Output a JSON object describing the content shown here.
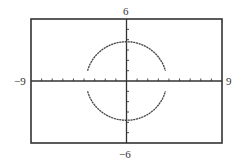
{
  "chart_data": {
    "type": "line",
    "title": "",
    "xlabel": "",
    "ylabel": "",
    "xlim": [
      -9,
      9
    ],
    "ylim": [
      -6,
      6
    ],
    "grid": false,
    "x_ticks_step": 1,
    "y_ticks_step": 1,
    "window_labels": {
      "xmin": "−9",
      "xmax": "9",
      "ymin": "−6",
      "ymax": "6"
    },
    "series": [
      {
        "name": "upper semicircle",
        "equation": "y = sqrt(r^2 - x^2)",
        "radius": 3.8,
        "center": [
          0,
          0
        ]
      },
      {
        "name": "lower semicircle",
        "equation": "y = -sqrt(r^2 - x^2)",
        "radius": 3.8,
        "center": [
          0,
          0
        ]
      }
    ]
  },
  "colors": {
    "frame": "#333333",
    "axis": "#333333",
    "curve": "#444444"
  }
}
